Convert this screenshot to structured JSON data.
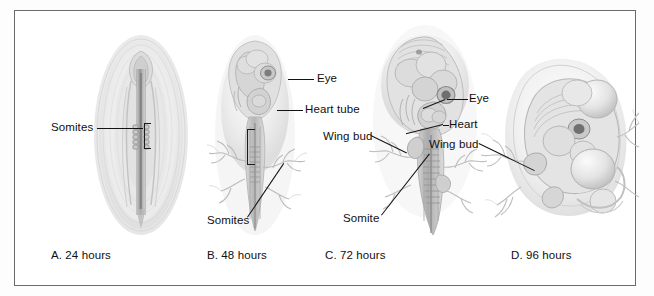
{
  "figure": {
    "border_color": "#6a6a6a",
    "background": "#ffffff"
  },
  "panels": [
    {
      "id": "panel-a",
      "caption": "A. 24 hours",
      "labels": [
        {
          "id": "somites-a",
          "text": "Somites"
        }
      ]
    },
    {
      "id": "panel-b",
      "caption": "B. 48 hours",
      "labels": [
        {
          "id": "eye-b",
          "text": "Eye"
        },
        {
          "id": "heart-tube-b",
          "text": "Heart tube"
        },
        {
          "id": "somites-b",
          "text": "Somites"
        }
      ]
    },
    {
      "id": "panel-c",
      "caption": "C. 72 hours",
      "labels": [
        {
          "id": "wing-bud-c",
          "text": "Wing bud"
        },
        {
          "id": "eye-c",
          "text": "Eye"
        },
        {
          "id": "heart-c",
          "text": "Heart"
        },
        {
          "id": "somite-c",
          "text": "Somite"
        }
      ]
    },
    {
      "id": "panel-d",
      "caption": "D. 96 hours",
      "labels": [
        {
          "id": "wing-bud-d",
          "text": "Wing bud"
        }
      ]
    }
  ]
}
